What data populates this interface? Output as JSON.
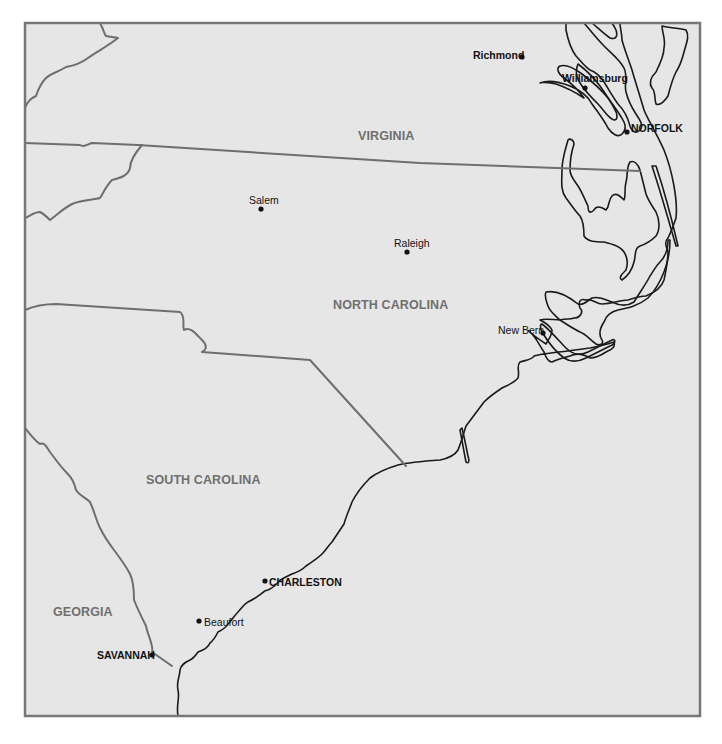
{
  "map": {
    "colors": {
      "land": "#e6e6e6",
      "water": "#fbfbfb",
      "frame": "#777777",
      "state_border": "#6e6e6e",
      "coastline": "#1a1a1a",
      "state_label": "#6f6f6f",
      "city_label": "#111111"
    },
    "states": [
      {
        "name": "VIRGINIA"
      },
      {
        "name": "NORTH CAROLINA"
      },
      {
        "name": "SOUTH CAROLINA"
      },
      {
        "name": "GEORGIA"
      }
    ],
    "cities": [
      {
        "name": "Richmond",
        "style": "bold"
      },
      {
        "name": "Williamsburg",
        "style": "bold"
      },
      {
        "name": "NORFOLK",
        "style": "bold-caps"
      },
      {
        "name": "Salem",
        "style": "regular"
      },
      {
        "name": "Raleigh",
        "style": "regular"
      },
      {
        "name": "New Bern",
        "style": "regular"
      },
      {
        "name": "CHARLESTON",
        "style": "bold-caps"
      },
      {
        "name": "Beaufort",
        "style": "regular"
      },
      {
        "name": "SAVANNAH",
        "style": "bold-caps"
      }
    ]
  }
}
